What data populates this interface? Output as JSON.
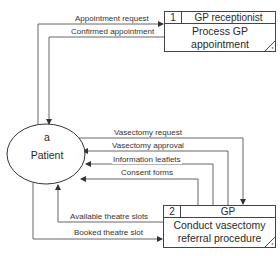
{
  "diagram": {
    "type": "data flow diagram",
    "external_entity": {
      "id": "a",
      "name": "Patient"
    },
    "processes": [
      {
        "id": "1",
        "actor": "GP receptionist",
        "name_line1": "Process GP",
        "name_line2": "appointment",
        "corner_mark": "*"
      },
      {
        "id": "2",
        "actor": "GP",
        "name_line1": "Conduct vasectomy",
        "name_line2": "referral procedure",
        "corner_mark": "*"
      }
    ],
    "flows": [
      {
        "label": "Appointment request",
        "from": "Patient",
        "to": "Process GP appointment"
      },
      {
        "label": "Confirmed appointment",
        "from": "Process GP appointment",
        "to": "Patient"
      },
      {
        "label": "Vasectomy request",
        "from": "Patient",
        "to": "Conduct vasectomy referral procedure"
      },
      {
        "label": "Vasectomy approval",
        "from": "Conduct vasectomy referral procedure",
        "to": "Patient"
      },
      {
        "label": "Information leaflets",
        "from": "Conduct vasectomy referral procedure",
        "to": "Patient"
      },
      {
        "label": "Consent forms",
        "from": "Conduct vasectomy referral procedure",
        "to": "Patient"
      },
      {
        "label": "Available theatre slots",
        "from": "Conduct vasectomy referral procedure",
        "to": "Patient"
      },
      {
        "label": "Booked theatre slot",
        "from": "Patient",
        "to": "Conduct vasectomy referral procedure"
      }
    ],
    "colors": {
      "line": "#444444",
      "text": "#2a2a2a",
      "background": "#ffffff"
    }
  }
}
